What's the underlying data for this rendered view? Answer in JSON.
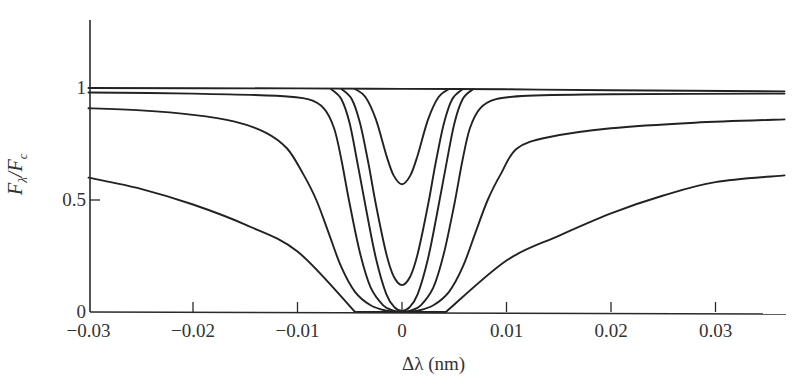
{
  "chart_data": {
    "type": "line",
    "title": "",
    "xlabel": "Δλ (nm)",
    "ylabel": "F_λ/F_c",
    "ylabel_parts": {
      "main": "F",
      "sub1": "λ",
      "slash": "/F",
      "sub2": "c"
    },
    "xlim": [
      -0.03,
      0.0366
    ],
    "ylim": [
      0,
      1.3
    ],
    "grid": false,
    "legend": null,
    "x_ticks": [
      -0.03,
      -0.02,
      -0.01,
      0,
      0.01,
      0.02,
      0.03
    ],
    "x_tick_labels": [
      "−0.03",
      "−0.02",
      "−0.01",
      "0",
      "0.01",
      "0.02",
      "0.03"
    ],
    "y_ticks": [
      0,
      0.5,
      1
    ],
    "y_tick_labels": [
      "0",
      "0.5",
      "1"
    ],
    "series": [
      {
        "name": "continuum",
        "x": [
          -0.03,
          -0.01,
          0,
          0.01,
          0.02,
          0.0366
        ],
        "y": [
          1.0,
          0.998,
          0.996,
          0.994,
          0.99,
          0.985
        ]
      },
      {
        "name": "line-depth-0.43",
        "x": [
          -0.0045,
          -0.0035,
          -0.0025,
          -0.0015,
          -0.0008,
          0,
          0.0008,
          0.0015,
          0.0025,
          0.0035,
          0.0045
        ],
        "y": [
          0.996,
          0.96,
          0.86,
          0.7,
          0.61,
          0.57,
          0.61,
          0.7,
          0.86,
          0.96,
          0.995
        ]
      },
      {
        "name": "line-depth-0.88",
        "x": [
          -0.0058,
          -0.0048,
          -0.004,
          -0.0032,
          -0.0025,
          -0.0015,
          -0.0008,
          0,
          0.0008,
          0.0015,
          0.0025,
          0.0032,
          0.004,
          0.0048,
          0.0058
        ],
        "y": [
          0.996,
          0.95,
          0.84,
          0.66,
          0.48,
          0.26,
          0.16,
          0.12,
          0.16,
          0.26,
          0.48,
          0.66,
          0.84,
          0.95,
          0.995
        ]
      },
      {
        "name": "line-saturated-narrow",
        "x": [
          -0.0068,
          -0.0058,
          -0.005,
          -0.0042,
          -0.0034,
          -0.0025,
          -0.0015,
          -0.0007,
          0,
          0.0007,
          0.0015,
          0.0025,
          0.0034,
          0.0042,
          0.005,
          0.0058,
          0.0068
        ],
        "y": [
          0.996,
          0.95,
          0.84,
          0.65,
          0.45,
          0.24,
          0.08,
          0.02,
          0.005,
          0.02,
          0.08,
          0.24,
          0.45,
          0.65,
          0.84,
          0.95,
          0.995
        ]
      },
      {
        "name": "line-saturated-wing-0.98",
        "x": [
          -0.03,
          -0.02,
          -0.012,
          -0.009,
          -0.0075,
          -0.0065,
          -0.0058,
          -0.005,
          -0.004,
          -0.003,
          -0.0018,
          -0.0008,
          0,
          0.0008,
          0.0018,
          0.003,
          0.004,
          0.005,
          0.0058,
          0.0065,
          0.0075,
          0.009,
          0.012,
          0.02,
          0.0366
        ],
        "y": [
          0.98,
          0.975,
          0.965,
          0.95,
          0.91,
          0.82,
          0.68,
          0.48,
          0.26,
          0.11,
          0.03,
          0.006,
          0.0,
          0.006,
          0.03,
          0.11,
          0.26,
          0.48,
          0.68,
          0.82,
          0.91,
          0.95,
          0.965,
          0.972,
          0.975
        ]
      },
      {
        "name": "line-saturated-wing-0.91",
        "x": [
          -0.03,
          -0.025,
          -0.02,
          -0.016,
          -0.013,
          -0.011,
          -0.0095,
          -0.0082,
          -0.007,
          -0.0058,
          -0.0045,
          -0.003,
          -0.0015,
          0,
          0.0015,
          0.003,
          0.0045,
          0.0058,
          0.007,
          0.0082,
          0.0095,
          0.011,
          0.014,
          0.02,
          0.028,
          0.0366
        ],
        "y": [
          0.91,
          0.9,
          0.88,
          0.85,
          0.8,
          0.73,
          0.62,
          0.5,
          0.35,
          0.2,
          0.09,
          0.03,
          0.006,
          0.0,
          0.006,
          0.03,
          0.09,
          0.2,
          0.35,
          0.5,
          0.62,
          0.73,
          0.78,
          0.82,
          0.845,
          0.86
        ]
      },
      {
        "name": "line-damping-wings",
        "x": [
          -0.03,
          -0.025,
          -0.02,
          -0.015,
          -0.01,
          -0.0045,
          0.0042,
          0.01,
          0.015,
          0.02,
          0.025,
          0.03,
          0.0366
        ],
        "y": [
          0.6,
          0.55,
          0.48,
          0.39,
          0.27,
          0.0,
          0.0,
          0.23,
          0.34,
          0.44,
          0.52,
          0.58,
          0.61
        ]
      }
    ]
  },
  "layout": {
    "origin_px": [
      402,
      312
    ],
    "px_per_x": 10450,
    "px_per_y": 224,
    "plot_left_px": 90,
    "plot_top_px": 20,
    "plot_right_px": 786
  }
}
